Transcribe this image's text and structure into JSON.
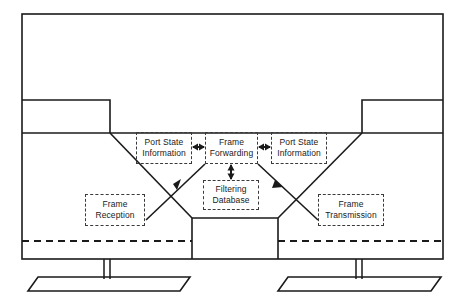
{
  "diagram": {
    "colors": {
      "stroke": "#1a1a1a",
      "box_border": "#3a3a3a",
      "background": "#ffffff",
      "text": "#1a1a1a"
    },
    "boxes": [
      {
        "id": "port-state-information-left",
        "line1": "Port State",
        "line2": "Information"
      },
      {
        "id": "frame-forwarding",
        "line1": "Frame",
        "line2": "Forwarding"
      },
      {
        "id": "port-state-information-right",
        "line1": "Port State",
        "line2": "Information"
      },
      {
        "id": "filtering-database",
        "line1": "Filtering",
        "line2": "Database"
      },
      {
        "id": "frame-reception",
        "line1": "Frame",
        "line2": "Reception"
      },
      {
        "id": "frame-transmission",
        "line1": "Frame",
        "line2": "Transmission"
      }
    ],
    "connectors": [
      {
        "id": "port-state-left-to-frame-forwarding",
        "style": "double-headed-horizontal-arrow"
      },
      {
        "id": "frame-forwarding-to-port-state-right",
        "style": "double-headed-horizontal-arrow"
      },
      {
        "id": "frame-forwarding-to-filtering-database",
        "style": "double-headed-vertical-arrow"
      },
      {
        "id": "frame-reception-to-frame-forwarding",
        "style": "single-headed-diagonal-arrow"
      },
      {
        "id": "frame-forwarding-to-frame-transmission",
        "style": "single-headed-diagonal-arrow"
      }
    ],
    "shapes": [
      {
        "id": "outer-frame",
        "style": "solid-rectangle"
      },
      {
        "id": "left-station-body",
        "style": "solid-outline"
      },
      {
        "id": "right-station-body",
        "style": "solid-outline"
      },
      {
        "id": "left-station-neck",
        "style": "solid-outline"
      },
      {
        "id": "right-station-neck",
        "style": "solid-outline"
      },
      {
        "id": "left-station-base",
        "style": "parallelogram-outline"
      },
      {
        "id": "right-station-base",
        "style": "parallelogram-outline"
      },
      {
        "id": "left-station-divider",
        "style": "dashed-horizontal-line"
      },
      {
        "id": "right-station-divider",
        "style": "dashed-horizontal-line"
      }
    ]
  }
}
